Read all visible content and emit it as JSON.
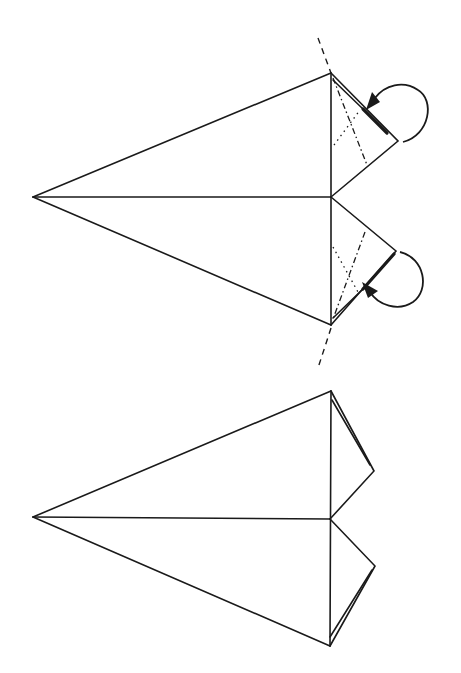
{
  "diagram": {
    "type": "origami-instruction",
    "colors": {
      "line": "#1a1a1a",
      "background": "#ffffff"
    },
    "steps": [
      {
        "name": "step-fold-wingtips",
        "tip": [
          33,
          197
        ],
        "center": [
          331,
          197
        ],
        "top": [
          331,
          73
        ],
        "bottom": [
          331,
          325
        ],
        "upper_flap_tip": [
          398,
          141
        ],
        "lower_flap_tip": [
          396,
          251
        ],
        "symbols": [
          "valley-fold-line",
          "mountain-fold-line",
          "hidden-line",
          "fold-behind-arrow"
        ]
      },
      {
        "name": "step-result",
        "tip": [
          33,
          517
        ],
        "center": [
          330,
          519
        ],
        "top": [
          331,
          391
        ],
        "bottom": [
          330,
          646
        ],
        "upper_flap_tip": [
          374,
          471
        ],
        "lower_flap_tip": [
          375,
          566
        ]
      }
    ]
  }
}
